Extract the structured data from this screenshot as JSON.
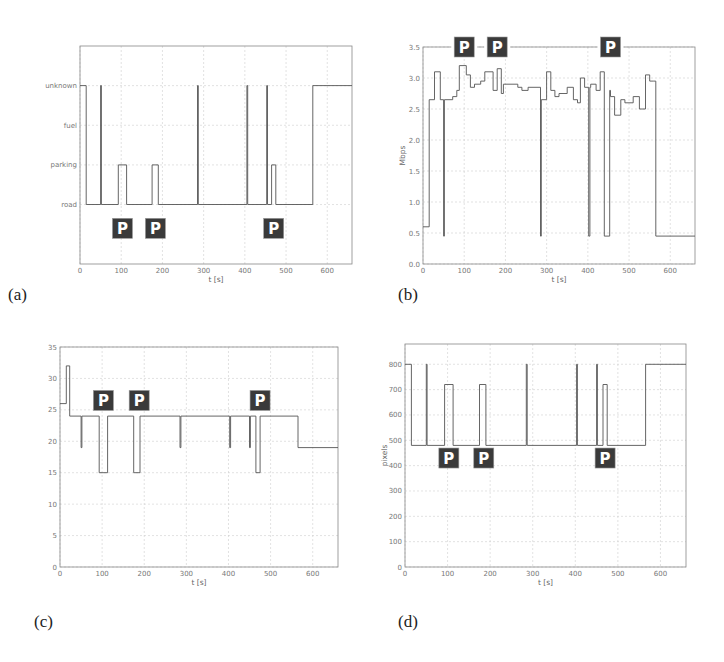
{
  "figure": {
    "panels": [
      {
        "id": "a",
        "label": "(a)"
      },
      {
        "id": "b",
        "label": "(b)"
      },
      {
        "id": "c",
        "label": "(c)"
      },
      {
        "id": "d",
        "label": "(d)"
      }
    ],
    "parking_icon_text": "P",
    "colors": {
      "line": "#555555",
      "grid": "#cfcfcf",
      "axis": "#888888",
      "icon_bg": "#3a3a3a",
      "icon_fg": "#ffffff"
    }
  },
  "chart_data": [
    {
      "id": "a",
      "type": "line",
      "step": true,
      "title": "",
      "xlabel": "t [s]",
      "ylabel": "",
      "xlim": [
        0,
        660
      ],
      "xticks": [
        0,
        100,
        200,
        300,
        400,
        500,
        600
      ],
      "yticks": [
        "road",
        "parking",
        "fuel",
        "unknown"
      ],
      "ylim": [
        -1.5,
        4
      ],
      "grid": true,
      "series": [
        {
          "name": "context",
          "x": [
            0,
            15,
            15,
            50,
            50,
            52,
            52,
            93,
            93,
            113,
            113,
            175,
            175,
            190,
            190,
            285,
            285,
            287,
            287,
            405,
            405,
            407,
            407,
            453,
            453,
            455,
            455,
            465,
            465,
            475,
            475,
            565,
            565,
            660
          ],
          "y": [
            3,
            3,
            0,
            0,
            3,
            3,
            0,
            0,
            1,
            1,
            0,
            0,
            1,
            1,
            0,
            0,
            3,
            3,
            0,
            0,
            3,
            3,
            0,
            0,
            3,
            3,
            0,
            0,
            1,
            1,
            0,
            0,
            3,
            3
          ]
        }
      ],
      "annotations": [
        {
          "text": "P",
          "x": 103,
          "y": -0.6
        },
        {
          "text": "P",
          "x": 183,
          "y": -0.6
        },
        {
          "text": "P",
          "x": 470,
          "y": -0.6
        }
      ]
    },
    {
      "id": "b",
      "type": "line",
      "step": true,
      "title": "",
      "xlabel": "t [s]",
      "ylabel": "Mbps",
      "xlim": [
        0,
        660
      ],
      "ylim": [
        0,
        3.5
      ],
      "xticks": [
        0,
        100,
        200,
        300,
        400,
        500,
        600
      ],
      "yticks": [
        0.0,
        0.5,
        1.0,
        1.5,
        2.0,
        2.5,
        3.0,
        3.5
      ],
      "grid": true,
      "series": [
        {
          "name": "bandwidth",
          "x": [
            0,
            15,
            15,
            28,
            28,
            42,
            42,
            50,
            50,
            52,
            52,
            72,
            72,
            82,
            82,
            88,
            88,
            105,
            105,
            115,
            115,
            125,
            125,
            140,
            140,
            150,
            150,
            170,
            170,
            180,
            180,
            190,
            190,
            195,
            195,
            230,
            230,
            240,
            240,
            255,
            255,
            285,
            285,
            287,
            287,
            300,
            300,
            310,
            310,
            320,
            320,
            330,
            330,
            350,
            350,
            365,
            365,
            375,
            375,
            382,
            382,
            392,
            392,
            402,
            402,
            405,
            405,
            407,
            407,
            420,
            420,
            430,
            430,
            440,
            440,
            453,
            453,
            455,
            455,
            465,
            465,
            480,
            480,
            490,
            490,
            510,
            510,
            525,
            525,
            540,
            540,
            550,
            550,
            560,
            560,
            565,
            565,
            660
          ],
          "y": [
            0.6,
            0.6,
            2.65,
            2.65,
            3.1,
            3.1,
            2.65,
            2.65,
            0.45,
            0.45,
            2.65,
            2.65,
            2.7,
            2.7,
            2.8,
            2.8,
            3.2,
            3.2,
            3.05,
            3.05,
            2.85,
            2.85,
            2.9,
            2.9,
            2.95,
            2.95,
            3.1,
            3.1,
            2.8,
            2.8,
            3.15,
            3.15,
            2.75,
            2.75,
            2.9,
            2.9,
            2.85,
            2.85,
            2.8,
            2.8,
            2.85,
            2.85,
            0.45,
            0.45,
            2.65,
            2.65,
            3.1,
            3.1,
            2.8,
            2.8,
            2.7,
            2.7,
            2.75,
            2.75,
            2.85,
            2.85,
            2.65,
            2.65,
            2.6,
            2.6,
            3.0,
            3.0,
            2.85,
            2.85,
            0.45,
            0.45,
            2.85,
            2.85,
            2.9,
            2.9,
            2.8,
            2.8,
            3.1,
            3.1,
            0.45,
            0.45,
            2.8,
            2.8,
            2.7,
            2.7,
            2.4,
            2.4,
            2.65,
            2.65,
            2.6,
            2.6,
            2.7,
            2.7,
            2.5,
            2.5,
            3.05,
            3.05,
            2.95,
            2.95,
            2.95,
            2.95,
            0.45,
            0.45
          ]
        }
      ],
      "annotations": [
        {
          "text": "P",
          "x": 100,
          "y": 3.5
        },
        {
          "text": "P",
          "x": 180,
          "y": 3.5
        },
        {
          "text": "P",
          "x": 455,
          "y": 3.5
        }
      ]
    },
    {
      "id": "c",
      "type": "line",
      "step": true,
      "title": "",
      "xlabel": "t [s]",
      "ylabel": "",
      "xlim": [
        0,
        660
      ],
      "ylim": [
        0,
        35
      ],
      "xticks": [
        0,
        100,
        200,
        300,
        400,
        500,
        600
      ],
      "yticks": [
        0,
        5,
        10,
        15,
        20,
        25,
        30,
        35
      ],
      "grid": true,
      "series": [
        {
          "name": "value",
          "x": [
            0,
            15,
            15,
            23,
            23,
            50,
            50,
            52,
            52,
            93,
            93,
            113,
            113,
            175,
            175,
            190,
            190,
            285,
            285,
            287,
            287,
            403,
            403,
            405,
            405,
            450,
            450,
            452,
            452,
            465,
            465,
            475,
            475,
            565,
            565,
            660
          ],
          "y": [
            26,
            26,
            32,
            32,
            24,
            24,
            19,
            19,
            24,
            24,
            15,
            15,
            24,
            24,
            15,
            15,
            24,
            24,
            19,
            19,
            24,
            24,
            19,
            19,
            24,
            24,
            19,
            19,
            24,
            24,
            15,
            15,
            24,
            24,
            19,
            19
          ]
        }
      ],
      "annotations": [
        {
          "text": "P",
          "x": 103,
          "y": 26.5
        },
        {
          "text": "P",
          "x": 188,
          "y": 26.5
        },
        {
          "text": "P",
          "x": 475,
          "y": 26.5
        }
      ]
    },
    {
      "id": "d",
      "type": "line",
      "step": true,
      "title": "",
      "xlabel": "t [s]",
      "ylabel": "pixels",
      "xlim": [
        0,
        660
      ],
      "ylim": [
        0,
        880
      ],
      "xticks": [
        0,
        100,
        200,
        300,
        400,
        500,
        600
      ],
      "yticks": [
        0,
        100,
        200,
        300,
        400,
        500,
        600,
        700,
        800
      ],
      "grid": true,
      "series": [
        {
          "name": "resolution",
          "x": [
            0,
            15,
            15,
            50,
            50,
            52,
            52,
            93,
            93,
            113,
            113,
            175,
            175,
            190,
            190,
            285,
            285,
            287,
            287,
            403,
            403,
            405,
            405,
            450,
            450,
            452,
            452,
            465,
            465,
            475,
            475,
            565,
            565,
            660
          ],
          "y": [
            800,
            800,
            480,
            480,
            800,
            800,
            480,
            480,
            720,
            720,
            480,
            480,
            720,
            720,
            480,
            480,
            800,
            800,
            480,
            480,
            800,
            800,
            480,
            480,
            800,
            800,
            480,
            480,
            720,
            720,
            480,
            480,
            800,
            800
          ]
        }
      ],
      "annotations": [
        {
          "text": "P",
          "x": 103,
          "y": 430
        },
        {
          "text": "P",
          "x": 185,
          "y": 430
        },
        {
          "text": "P",
          "x": 470,
          "y": 430
        }
      ]
    }
  ]
}
